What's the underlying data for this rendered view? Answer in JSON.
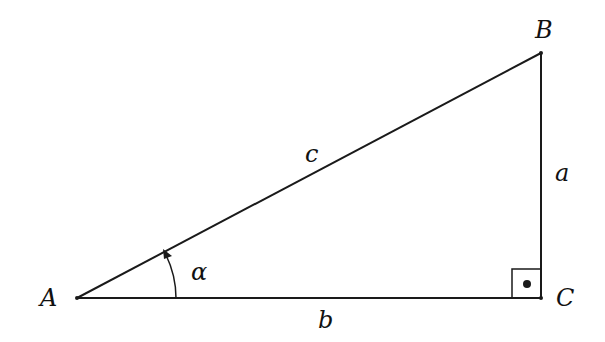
{
  "diagram": {
    "colors": {
      "stroke": "#1a1a1a",
      "background": "#ffffff"
    },
    "vertices": {
      "A": {
        "label": "A",
        "x": 77,
        "y": 298
      },
      "B": {
        "label": "B",
        "x": 541,
        "y": 53
      },
      "C": {
        "label": "C",
        "x": 541,
        "y": 298
      }
    },
    "sides": {
      "a": {
        "label": "a",
        "from": "B",
        "to": "C"
      },
      "b": {
        "label": "b",
        "from": "A",
        "to": "C"
      },
      "c": {
        "label": "c",
        "from": "A",
        "to": "B"
      }
    },
    "angle": {
      "label": "α",
      "at": "A",
      "marker": "arc-arrow"
    },
    "right_angle": {
      "at": "C",
      "marker": "square-with-dot"
    }
  }
}
